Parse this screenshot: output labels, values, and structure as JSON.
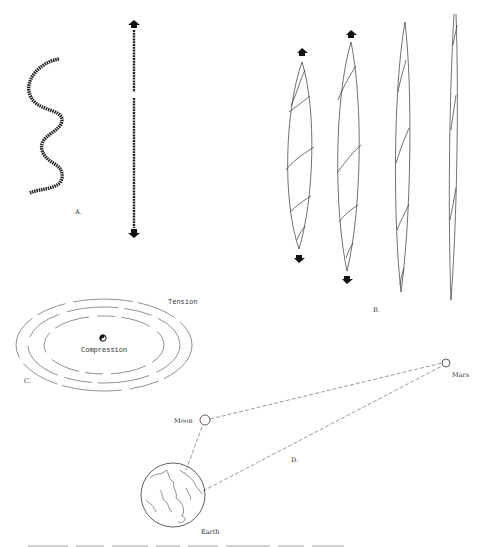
{
  "figure": {
    "panels": {
      "A": {
        "label": "A."
      },
      "B": {
        "label": "B."
      },
      "C": {
        "label": "C.",
        "outer_label": "Tension",
        "inner_label": "Compression"
      },
      "D": {
        "label": "D.",
        "bodies": [
          {
            "name": "Moon"
          },
          {
            "name": "Mars"
          },
          {
            "name": "Earth"
          }
        ]
      }
    },
    "colors": {
      "line": "#333333",
      "background": "#ffffff"
    }
  }
}
